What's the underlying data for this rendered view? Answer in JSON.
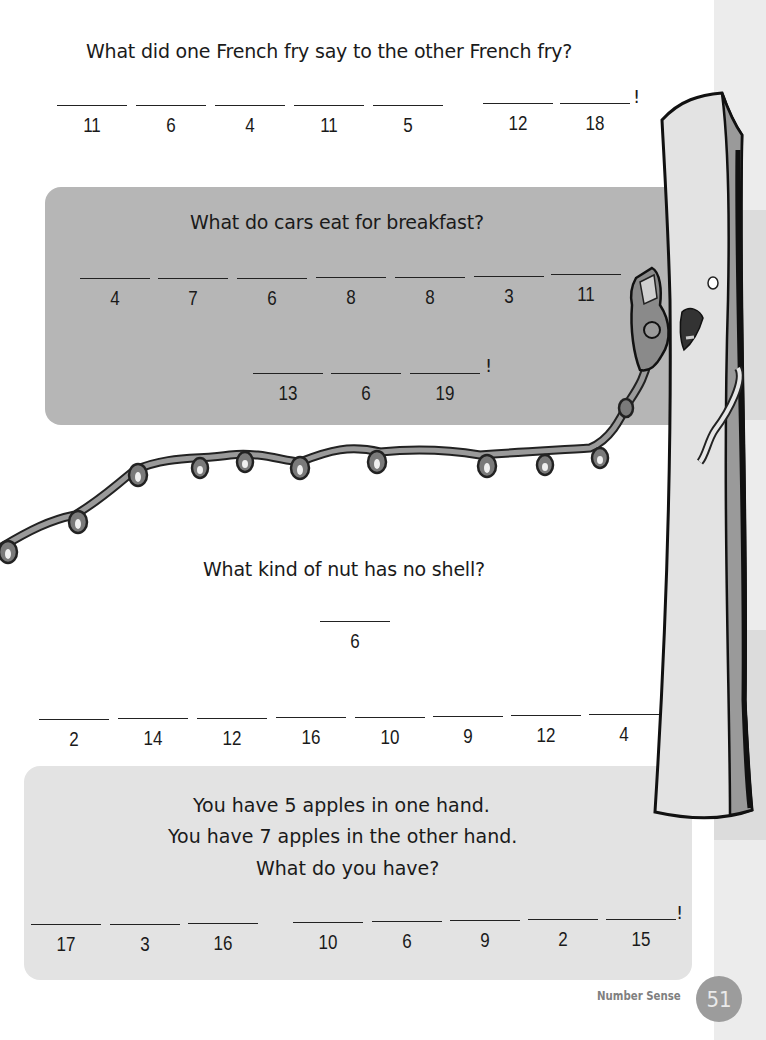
{
  "page": {
    "section_label": "Number Sense",
    "page_number": "51",
    "colors": {
      "box_dark": "#b6b6b6",
      "box_light": "#e3e3e3",
      "strip_light": "#ececec",
      "strip_dark": "#dcdcdc",
      "page_badge": "#9c9c9c"
    }
  },
  "puzzles": [
    {
      "question": "What did one French fry say to the other French fry?",
      "words": [
        [
          "11",
          "6",
          "4",
          "11",
          "5"
        ],
        [
          "12",
          "18"
        ]
      ],
      "ending": "!"
    },
    {
      "question": "What do cars eat for breakfast?",
      "words": [
        [
          "4",
          "7",
          "6",
          "8",
          "8",
          "3",
          "11"
        ],
        [
          "13",
          "6",
          "19"
        ]
      ],
      "ending": "!"
    },
    {
      "question": "What kind of nut has no shell?",
      "words": [
        [
          "6"
        ],
        [
          "2",
          "14",
          "12",
          "16",
          "10",
          "9",
          "12",
          "4"
        ]
      ],
      "ending": ""
    },
    {
      "question_lines": [
        "You have 5 apples in one hand.",
        "You have 7 apples in the other hand.",
        "What do you have?"
      ],
      "words": [
        [
          "17",
          "3",
          "16"
        ],
        [
          "10",
          "6",
          "9",
          "2",
          "15"
        ]
      ],
      "ending": "!"
    }
  ],
  "illustration": {
    "subject": "french-fry-character-on-phone",
    "elements": [
      "french-fry",
      "telephone-handset",
      "coiled-phone-cord"
    ]
  }
}
